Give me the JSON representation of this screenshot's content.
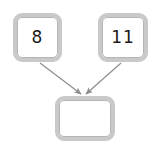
{
  "diagram": {
    "type": "flow-diagram",
    "background_color": "#ffffff",
    "width": 158,
    "height": 154,
    "node_border_color": "#c9c9c9",
    "node_fill_color": "#ffffff",
    "edge_color": "#8c8c8c",
    "text_color": "#1a1a1a",
    "nodes": [
      {
        "id": "node-a",
        "label": "8",
        "shape": "rounded-rectangle",
        "x": 13,
        "y": 13,
        "width": 49,
        "height": 49
      },
      {
        "id": "node-b",
        "label": "11",
        "shape": "rounded-rectangle",
        "x": 98,
        "y": 13,
        "width": 50,
        "height": 49
      },
      {
        "id": "node-c",
        "label": "",
        "shape": "rounded-rectangle",
        "x": 55,
        "y": 96,
        "width": 60,
        "height": 45
      }
    ],
    "edges": [
      {
        "id": "edge-a-to-c",
        "from": "node-a",
        "to": "node-c",
        "arrow": "arrowhead-end",
        "from_x": 40,
        "from_y": 63,
        "to_x": 81,
        "to_y": 95
      },
      {
        "id": "edge-b-to-c",
        "from": "node-b",
        "to": "node-c",
        "arrow": "arrowhead-end",
        "from_x": 121,
        "from_y": 63,
        "to_x": 86,
        "to_y": 95
      }
    ]
  }
}
